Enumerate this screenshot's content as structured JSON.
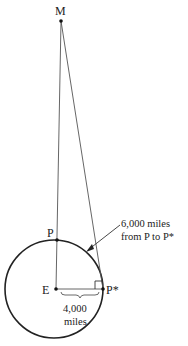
{
  "diagram": {
    "points": {
      "M": {
        "label": "M",
        "x": 61,
        "y": 21
      },
      "P": {
        "label": "P",
        "x": 57,
        "y": 240
      },
      "E": {
        "label": "E",
        "x": 56,
        "y": 289
      },
      "P_star": {
        "label": "P*",
        "x": 103,
        "y": 289
      }
    },
    "circle": {
      "cx": 54,
      "cy": 289,
      "r": 49
    },
    "annotations": {
      "arc_label_line1": "6,000 miles",
      "arc_label_line2": "from P to P*",
      "radius_label_line1": "4,000",
      "radius_label_line2": "miles"
    },
    "colors": {
      "stroke": "#222222",
      "thin": "#555555"
    }
  }
}
